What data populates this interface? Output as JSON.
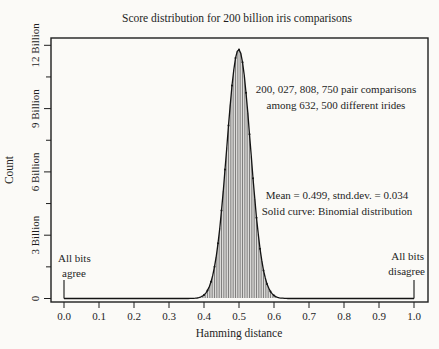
{
  "figure": {
    "background": "#fbfaf7",
    "ink": "#1e1e1e",
    "bar_color": "#3c3c3c",
    "curve_color": "#141414"
  },
  "chart_data": {
    "type": "bar",
    "subtype": "histogram-with-fitted-curve",
    "title": "Score distribution for 200 billion iris comparisons",
    "xlabel": "Hamming distance",
    "ylabel": "Count",
    "xlim": [
      0.0,
      1.0
    ],
    "ylim_billions": [
      0,
      12.2
    ],
    "grid": false,
    "legend": "none",
    "x_ticks": [
      {
        "value": 0.0,
        "label": "0.0"
      },
      {
        "value": 0.1,
        "label": "0.1"
      },
      {
        "value": 0.2,
        "label": "0.2"
      },
      {
        "value": 0.3,
        "label": "0.3"
      },
      {
        "value": 0.4,
        "label": "0.4"
      },
      {
        "value": 0.5,
        "label": "0.5"
      },
      {
        "value": 0.6,
        "label": "0.6"
      },
      {
        "value": 0.7,
        "label": "0.7"
      },
      {
        "value": 0.8,
        "label": "0.8"
      },
      {
        "value": 0.9,
        "label": "0.9"
      },
      {
        "value": 1.0,
        "label": "1.0"
      }
    ],
    "y_ticks": [
      {
        "value_billions": 0,
        "label": "0"
      },
      {
        "value_billions": 3,
        "label": "3 Billion"
      },
      {
        "value_billions": 6,
        "label": "6 Billion"
      },
      {
        "value_billions": 9,
        "label": "9 Billion"
      },
      {
        "value_billions": 12,
        "label": "12 Billion"
      }
    ],
    "y_minor_ticks_billions": [
      1.5,
      4.5,
      7.5,
      10.5
    ],
    "distribution": {
      "fit": "binomial",
      "mean": 0.499,
      "std_dev": 0.034,
      "peak_count_billions": 11.8,
      "bin_width": 0.005,
      "visible_range": [
        0.36,
        0.64
      ],
      "total_pair_comparisons": 200027808750,
      "different_irides": 632500
    },
    "curve_points_billions": [
      [
        0.36,
        0.003
      ],
      [
        0.38,
        0.026
      ],
      [
        0.4,
        0.17
      ],
      [
        0.42,
        0.79
      ],
      [
        0.44,
        2.62
      ],
      [
        0.45,
        4.18
      ],
      [
        0.46,
        6.11
      ],
      [
        0.47,
        8.2
      ],
      [
        0.48,
        10.09
      ],
      [
        0.49,
        11.39
      ],
      [
        0.5,
        11.8
      ],
      [
        0.51,
        11.19
      ],
      [
        0.52,
        9.75
      ],
      [
        0.53,
        7.79
      ],
      [
        0.54,
        5.7
      ],
      [
        0.55,
        3.83
      ],
      [
        0.56,
        2.36
      ],
      [
        0.58,
        0.69
      ],
      [
        0.6,
        0.14
      ],
      [
        0.62,
        0.021
      ],
      [
        0.64,
        0.002
      ]
    ],
    "annotations": {
      "pair_comparisons": {
        "line1": "200, 027, 808, 750 pair comparisons",
        "line2": "among 632, 500 different irides"
      },
      "stats": {
        "line1": "Mean = 0.499, stnd.dev. = 0.034",
        "line2": "Solid curve: Binomial distribution"
      }
    },
    "endpoint_labels": {
      "left": {
        "line1": "All bits",
        "line2": "agree",
        "x": 0.0
      },
      "right": {
        "line1": "All bits",
        "line2": "disagree",
        "x": 1.0
      }
    }
  }
}
